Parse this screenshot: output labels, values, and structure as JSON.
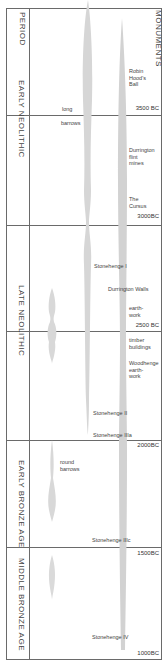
{
  "headers": {
    "period": "PERIOD",
    "monuments": "MONUMENTS"
  },
  "periods": [
    {
      "label": "EARLY  NEOLITHIC"
    },
    {
      "label": "LATE  NEOLITHIC"
    },
    {
      "label": "EARLY  BRONZE  AGE"
    },
    {
      "label": "MIDDLE  BRONZE  AGE"
    }
  ],
  "dates": [
    "3500 BC",
    "3000BC",
    "2500 BC",
    "2000BC",
    "1500BC",
    "1000BC"
  ],
  "labels": {
    "long": "long",
    "barrows": "barrows",
    "robin_hoods_ball": [
      "Robin",
      "Hood's",
      "Ball"
    ],
    "durrington_flint_mines": [
      "Durrington",
      "flint",
      "mines"
    ],
    "the_cursus": [
      "The",
      "Cursus"
    ],
    "stonehenge_1": "Stonehenge I",
    "durrington_walls": "Durrington Walls",
    "earthwork": [
      "earth-",
      "work"
    ],
    "timber_buildings": [
      "timber",
      "buildings"
    ],
    "woodhenge_earthwork": [
      "Woodhenge",
      "earth-",
      "work"
    ],
    "stonehenge_2": "Stonehenge II",
    "stonehenge_3a": "Stonehenge IIIa",
    "round_barrows": [
      "round",
      "barrows"
    ],
    "stonehenge_3c": "Stonehenge IIIc",
    "stonehenge_4": "Stonehenge IV"
  },
  "colors": {
    "band": "#d4d4d4",
    "line": "#6a6a6a"
  }
}
